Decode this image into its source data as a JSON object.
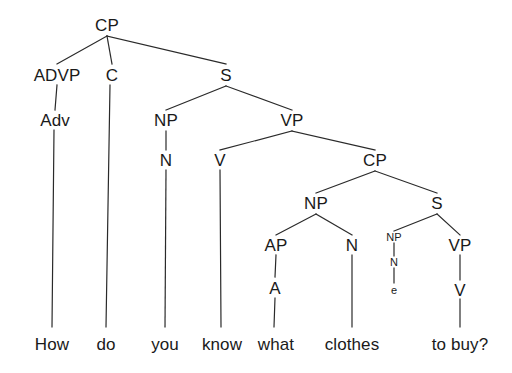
{
  "figure": {
    "kind": "syntax-tree-diagram",
    "sentence": "How do you know what clothes to buy?",
    "background_color": "#ffffff",
    "line_color": "#2a2a2a",
    "text_color": "#1a1a1a"
  },
  "nodes": {
    "cp_root": "CP",
    "advp": "ADVP",
    "c": "C",
    "s_main": "S",
    "adv": "Adv",
    "np_subj": "NP",
    "vp_main": "VP",
    "n_subj": "N",
    "v_main": "V",
    "cp_embedded": "CP",
    "np_wh": "NP",
    "s_embedded": "S",
    "ap": "AP",
    "n_clothes": "N",
    "np_empty": "NP",
    "vp_inf": "VP",
    "a_what": "A",
    "n_empty": "N",
    "v_inf": "V",
    "e_trace": "e"
  },
  "words": {
    "how": "How",
    "do": "do",
    "you": "you",
    "know": "know",
    "what": "what",
    "clothes": "clothes",
    "to_buy": "to buy?"
  }
}
